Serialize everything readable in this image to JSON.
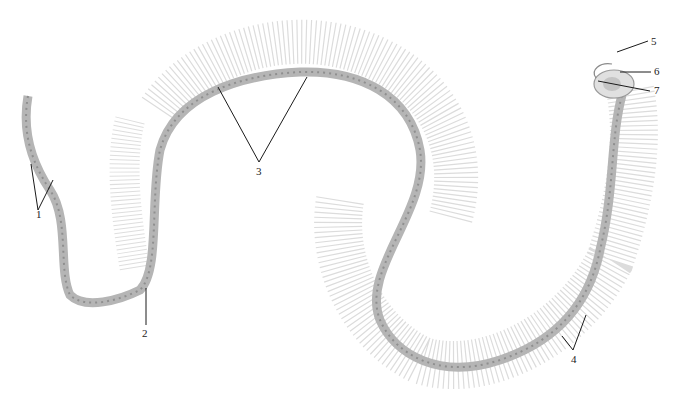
{
  "figure": {
    "labels": [
      {
        "id": "1",
        "text": "1",
        "x": 38,
        "y": 217
      },
      {
        "id": "2",
        "text": "2",
        "x": 144,
        "y": 332
      },
      {
        "id": "3",
        "text": "3",
        "x": 258,
        "y": 172
      },
      {
        "id": "4",
        "text": "4",
        "x": 573,
        "y": 358
      },
      {
        "id": "5",
        "text": "5",
        "x": 653,
        "y": 13
      },
      {
        "id": "6",
        "text": "6",
        "x": 656,
        "y": 68
      },
      {
        "id": "7",
        "text": "7",
        "x": 656,
        "y": 88
      }
    ],
    "colors": {
      "background": "#ffffff",
      "bone": "#b8b8b8",
      "rib": "#c8c8c8",
      "leader_line": "#1a1a1a"
    }
  }
}
